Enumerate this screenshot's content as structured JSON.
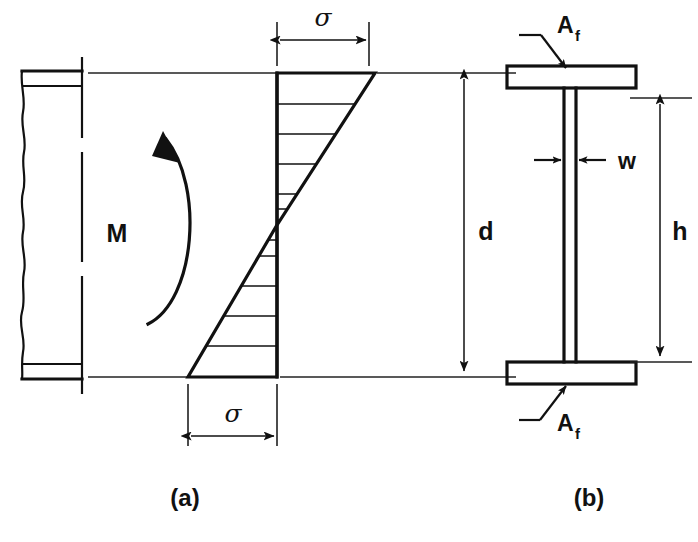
{
  "figure": {
    "captions": {
      "left": "(a)",
      "right": "(b)"
    }
  },
  "panel_a": {
    "name": "beam-elevation-and-stress-distribution",
    "moment_label": "M",
    "stress_label_top": "σ",
    "stress_label_bottom": "σ",
    "depth_label": "d",
    "hatch_line_count_top": 5,
    "hatch_line_count_bottom": 5,
    "description": "Beam side view with break line on left, neutral axis centerline, linear bending stress diagram (compression above, tension below) and overall depth d"
  },
  "panel_b": {
    "name": "i-beam-cross-section",
    "flange_label_top": "A",
    "flange_label_top_sub": "f",
    "flange_label_bottom": "A",
    "flange_label_bottom_sub": "f",
    "web_thickness_label": "w",
    "height_label": "h",
    "description": "I-beam cross section showing top and bottom flange areas A_f, web thickness w and height h"
  },
  "colors": {
    "ink": "#111111",
    "background": "#ffffff"
  }
}
